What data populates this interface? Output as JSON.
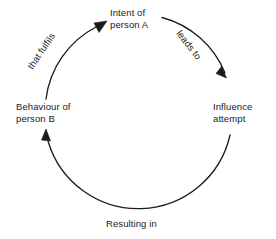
{
  "diagram": {
    "type": "cycle-diagram",
    "direction": "clockwise",
    "colors": {
      "background": "#ffffff",
      "stroke": "#1a1a1a",
      "text": "#1a1a1a"
    },
    "geometry": {
      "center_x": 139,
      "center_y": 110,
      "radius": 94
    },
    "nodes": [
      {
        "id": "intent",
        "line1": "Intent of",
        "line2": "person A",
        "position": "top"
      },
      {
        "id": "influence",
        "line1": "Influence",
        "line2": "attempt",
        "position": "right"
      },
      {
        "id": "behaviour",
        "line1": "Behaviour of",
        "line2": "person B",
        "position": "left"
      },
      {
        "id": "resulting",
        "line1": "Resulting in",
        "line2": "",
        "position": "bottom"
      }
    ],
    "arc_labels": [
      {
        "id": "leads-to",
        "text": "leads to",
        "position": "upper-right",
        "rotation_deg": 52
      },
      {
        "id": "that-fulfils",
        "text": "that fulfils",
        "position": "upper-left",
        "rotation_deg": -56
      }
    ],
    "arrowheads": [
      {
        "id": "arrow-into-intent",
        "points_to": "Intent of person A",
        "position": "upper-left"
      },
      {
        "id": "arrow-into-influence",
        "points_to": "Influence attempt",
        "position": "upper-right"
      },
      {
        "id": "arrow-into-behaviour",
        "points_to": "Behaviour of person B",
        "position": "lower-left"
      }
    ]
  }
}
